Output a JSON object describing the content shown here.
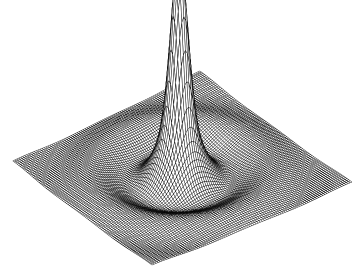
{
  "figure": {
    "title": "",
    "background_color": "#ffffff",
    "width": 360,
    "height": 274,
    "alt_text": "Wireframe mesh surface plot of a radially symmetric sombrero function with a tall narrow central spike and concentric damped ripple rings"
  },
  "chart_data": {
    "type": "surface",
    "render_style": "wireframe-mesh",
    "title": "",
    "subtitle": "",
    "xlabel": "",
    "ylabel": "",
    "zlabel": "",
    "grid": false,
    "axes_visible": false,
    "tick_labels": [],
    "legend": [],
    "annotations": [],
    "line_color": "#000000",
    "line_width": 0.45,
    "face_color": "#ffffff",
    "mesh_rows": 96,
    "mesh_cols": 96,
    "xlim": [
      -8,
      8
    ],
    "ylim": [
      -8,
      8
    ],
    "zlim": [
      -0.25,
      1.0
    ],
    "function": "spike_plus_sombrero",
    "function_expression": "z = A*exp(-(r/s)^2) + B*sin(k*r)/(k*r)",
    "function_params": {
      "A": 0.82,
      "s": 0.78,
      "B": 0.3,
      "k": 1.25,
      "damping": 0.13
    },
    "projection": {
      "type": "oblique-isometric",
      "elevation_deg": 28,
      "azimuth_deg": 45,
      "z_scale": 195
    },
    "plane_corners_px": {
      "left": [
        13,
        162
      ],
      "far": [
        200,
        72
      ],
      "right": [
        352,
        183
      ],
      "near": [
        152,
        266
      ]
    },
    "peak_apex_px": [
      177,
      10
    ],
    "peak_height_normalized": 1.0,
    "ring_count": 3,
    "series": [
      {
        "name": "surface",
        "description": "radial sombrero surface with central spike"
      }
    ]
  }
}
